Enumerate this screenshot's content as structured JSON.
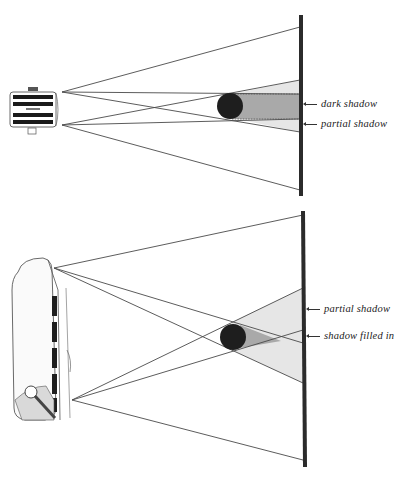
{
  "figure": {
    "top_panel": {
      "name": "small-light-source",
      "light_source": "spotlight-front-view",
      "labels": [
        {
          "id": "dark",
          "text": "dark shadow"
        },
        {
          "id": "partial",
          "text": "partial shadow"
        }
      ]
    },
    "bottom_panel": {
      "name": "broad-light-source",
      "light_source": "softbox-angled-view",
      "labels": [
        {
          "id": "partial",
          "text": "partial shadow"
        },
        {
          "id": "filled",
          "text": "shadow filled in"
        }
      ]
    },
    "colors": {
      "wall": "#2b2b2b",
      "sphere": "#1e1e1e",
      "dark_shadow": "#a9a9a9",
      "partial_shadow": "#e6e6e6",
      "rays": "#4a4a4a"
    }
  }
}
